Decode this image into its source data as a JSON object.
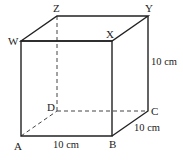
{
  "figure": {
    "type": "cube",
    "vertices": {
      "W": {
        "label": "W"
      },
      "X": {
        "label": "X"
      },
      "Y": {
        "label": "Y"
      },
      "Z": {
        "label": "Z"
      },
      "A": {
        "label": "A"
      },
      "B": {
        "label": "B"
      },
      "C": {
        "label": "C"
      },
      "D": {
        "label": "D"
      }
    },
    "dimensions": {
      "height": "10 cm",
      "length": "10 cm",
      "depth": "10 cm"
    },
    "colors": {
      "line": "#222222",
      "background": "#ffffff"
    }
  }
}
